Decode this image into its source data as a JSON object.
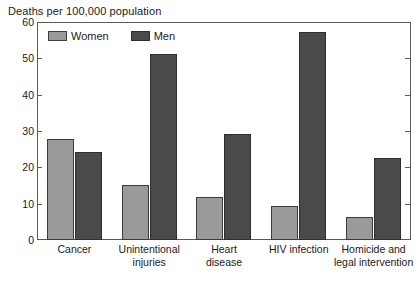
{
  "chart_data": {
    "type": "bar",
    "title": "Deaths per 100,000 population",
    "xlabel": "",
    "ylabel": "",
    "ylim": [
      0,
      60
    ],
    "yticks": [
      0,
      10,
      20,
      30,
      40,
      50,
      60
    ],
    "grid": false,
    "legend_position": "top-left-inside",
    "categories": [
      "Cancer",
      "Unintentional injuries",
      "Heart disease",
      "HIV infection",
      "Homicide and legal intervention"
    ],
    "category_lines": [
      [
        "Cancer"
      ],
      [
        "Unintentional",
        "injuries"
      ],
      [
        "Heart",
        "disease"
      ],
      [
        "HIV infection"
      ],
      [
        "Homicide and",
        "legal intervention"
      ]
    ],
    "series": [
      {
        "name": "Women",
        "color": "#9a9a9a",
        "values": [
          27.8,
          15.2,
          11.8,
          9.4,
          6.4
        ]
      },
      {
        "name": "Men",
        "color": "#4a4a4a",
        "values": [
          24.3,
          51.3,
          29.2,
          57.2,
          22.6
        ]
      }
    ]
  },
  "legend": {
    "items": [
      {
        "label": "Women",
        "swatch": "legend-swatch-women"
      },
      {
        "label": "Men",
        "swatch": "legend-swatch-men"
      }
    ]
  },
  "axis": {
    "y_tick_labels": [
      "60",
      "50",
      "40",
      "30",
      "20",
      "10",
      "0"
    ]
  }
}
